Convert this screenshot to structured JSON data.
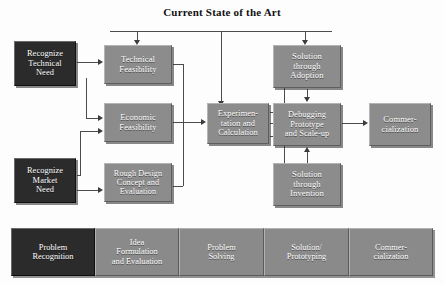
{
  "title": "Current State of the Art",
  "nodes": {
    "recognize_technical_need": "Recognize\nTechnical\nNeed",
    "recognize_market_need": "Recognize\nMarket\nNeed",
    "technical_feasibility": "Technical\nFeasibility",
    "economic_feasibility": "Economic\nFeasibility",
    "rough_design": "Rough Design\nConcept and\nEvaluation",
    "experimentation": "Experimen-\ntation and\nCalculation",
    "solution_adoption": "Solution\nthrough\nAdoption",
    "debugging_prototype": "Debugging\nPrototype\nand Scale-up",
    "solution_invention": "Solution\nthrough\nInvention",
    "commercialization": "Commer-\ncialization"
  },
  "phases": [
    {
      "label": "Problem\nRecognition"
    },
    {
      "label": "Idea\nFormulation\nand Evaluation"
    },
    {
      "label": "Problem\nSolving"
    },
    {
      "label": "Solution/\nPrototyping"
    },
    {
      "label": "Commer-\ncialization"
    }
  ],
  "colors": {
    "dark_box": "#2b2b2b",
    "gray_box": "#8c8c8c",
    "connector": "#4c4c4c",
    "text": "#ffffff",
    "title": "#111111",
    "background": "#fdfdfd"
  }
}
